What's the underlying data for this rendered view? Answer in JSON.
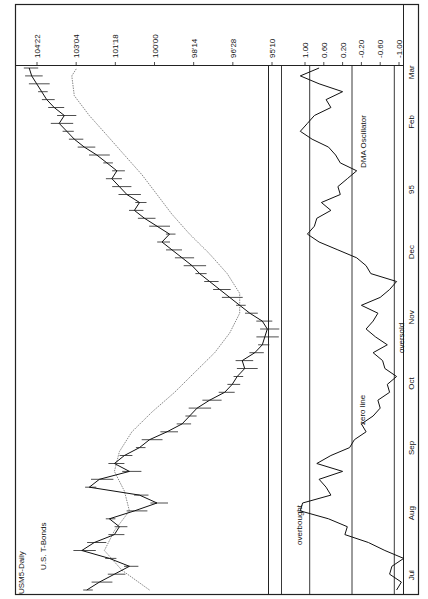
{
  "chart_data": [
    {
      "type": "line",
      "title": "USM5-Daily",
      "subtitle": "U.S. T-Bonds",
      "orientation": "rotated-90-ccw",
      "xlabel": "",
      "ylabel": "",
      "x_ticks": [
        "Jul",
        "Aug",
        "Sep",
        "Oct",
        "Nov",
        "Dec",
        "95",
        "Feb",
        "Mar"
      ],
      "y_ticks": [
        "95'10",
        "96'28",
        "98'14",
        "100'00",
        "101'18",
        "103'04",
        "104'22"
      ],
      "y_tick_values": [
        95.3125,
        96.875,
        98.4375,
        100.0,
        101.5625,
        103.125,
        104.6875
      ],
      "ylim": [
        95.0,
        105.4
      ],
      "grid": false,
      "series": [
        {
          "name": "Price (daily bars, close)",
          "x": [
            0,
            4,
            8,
            12,
            16,
            20,
            24,
            28,
            32,
            36,
            40,
            44,
            48,
            52,
            56,
            60,
            64,
            68,
            72,
            76,
            80,
            84,
            88,
            92,
            96,
            100,
            104,
            108,
            112,
            116,
            120,
            124,
            128,
            132,
            136,
            140,
            144,
            148,
            152,
            156,
            160,
            164,
            168,
            172,
            176,
            180,
            184,
            188,
            192,
            196,
            200,
            204,
            208,
            212,
            216,
            220,
            224,
            228,
            232,
            236,
            240,
            244,
            248,
            252,
            256,
            260,
            264
          ],
          "values": [
            102.7,
            102.2,
            101.6,
            101.0,
            101.8,
            102.9,
            102.4,
            101.6,
            101.4,
            101.8,
            100.8,
            99.9,
            100.6,
            102.6,
            102.2,
            101.0,
            101.6,
            101.2,
            100.6,
            100.2,
            99.5,
            98.9,
            98.6,
            98.3,
            97.8,
            97.2,
            96.9,
            96.7,
            96.4,
            96.5,
            96.0,
            95.7,
            95.6,
            95.5,
            95.7,
            96.2,
            96.6,
            97.0,
            97.4,
            97.8,
            98.2,
            98.5,
            98.9,
            99.3,
            99.7,
            99.4,
            99.9,
            100.4,
            100.8,
            100.6,
            101.1,
            101.4,
            101.7,
            101.5,
            101.9,
            102.3,
            102.8,
            103.2,
            103.5,
            103.8,
            103.6,
            104.0,
            104.3,
            104.5,
            104.7,
            104.9,
            105.0
          ]
        },
        {
          "name": "DMA (moving average)",
          "x": [
            0,
            10,
            20,
            30,
            40,
            50,
            60,
            70,
            80,
            90,
            100,
            110,
            120,
            130,
            140,
            150,
            160,
            170,
            180,
            190,
            200,
            210,
            220,
            230,
            240,
            250,
            260,
            264
          ],
          "values": [
            100.2,
            101.3,
            102.0,
            101.6,
            101.0,
            101.2,
            101.6,
            101.4,
            100.9,
            100.1,
            99.2,
            98.4,
            97.6,
            97.0,
            96.6,
            96.6,
            97.1,
            97.8,
            98.6,
            99.3,
            99.9,
            100.5,
            101.2,
            101.9,
            102.6,
            103.2,
            103.3,
            103.1
          ]
        }
      ],
      "annotations": []
    },
    {
      "type": "line",
      "title": "DMA Oscillator",
      "x_ticks": [
        "Jul",
        "Aug",
        "Sep",
        "Oct",
        "Nov",
        "Dec",
        "95",
        "Feb",
        "Mar"
      ],
      "y_ticks": [
        "1.00",
        "0.60",
        "0.20",
        "-0.20",
        "-0.60",
        "-1.00"
      ],
      "y_tick_values": [
        1.0,
        0.6,
        0.2,
        -0.2,
        -0.6,
        -1.0
      ],
      "ylim": [
        -1.3,
        1.3
      ],
      "grid": false,
      "reference_lines": [
        {
          "label": "overbought",
          "value": 0.9
        },
        {
          "label": "zero line",
          "value": 0.0
        },
        {
          "label": "oversold",
          "value": -0.9
        }
      ],
      "series": [
        {
          "name": "DMA Oscillator",
          "x": [
            0,
            4,
            8,
            12,
            16,
            20,
            24,
            28,
            32,
            36,
            40,
            44,
            48,
            52,
            56,
            60,
            64,
            68,
            72,
            76,
            80,
            84,
            88,
            92,
            96,
            100,
            104,
            108,
            112,
            116,
            120,
            124,
            128,
            132,
            136,
            140,
            144,
            148,
            152,
            156,
            160,
            164,
            168,
            172,
            176,
            180,
            184,
            188,
            192,
            196,
            200,
            204,
            208,
            212,
            216,
            220,
            224,
            228,
            232,
            236,
            240,
            244,
            248,
            252,
            256,
            260,
            264
          ],
          "values": [
            -0.95,
            -1.05,
            -0.8,
            -0.85,
            -1.1,
            -0.7,
            -0.35,
            0.15,
            0.1,
            0.5,
            1.1,
            1.05,
            0.45,
            0.55,
            0.7,
            0.2,
            0.75,
            0.45,
            0.05,
            -0.05,
            -0.3,
            -0.2,
            -0.45,
            -0.6,
            -0.55,
            -0.8,
            -0.75,
            -0.95,
            -0.7,
            -0.65,
            -0.45,
            -0.75,
            -0.5,
            -0.3,
            -0.45,
            -0.55,
            -0.2,
            -0.6,
            -0.8,
            -0.95,
            -0.4,
            -0.3,
            -0.1,
            0.3,
            0.7,
            0.95,
            0.8,
            0.75,
            0.45,
            0.65,
            0.25,
            0.3,
            0.1,
            -0.1,
            0.25,
            0.35,
            0.5,
            0.85,
            1.1,
            0.95,
            0.8,
            0.45,
            0.55,
            0.2,
            0.7,
            1.1,
            0.7
          ]
        }
      ],
      "annotations": [
        "overbought",
        "zero line",
        "oversold",
        "DMA Oscillator"
      ]
    }
  ],
  "labels": {
    "title": "USM5-Daily",
    "subtitle": "U.S. T-Bonds",
    "osc_title": "DMA Oscillator",
    "overbought": "overbought",
    "zero_line": "zero line",
    "oversold": "oversold"
  }
}
